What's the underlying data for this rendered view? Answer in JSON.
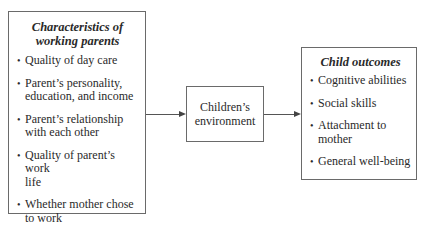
{
  "diagram": {
    "left_box": {
      "title_line1": "Characteristics of",
      "title_line2": "working parents",
      "items": [
        {
          "line1": "Quality of day care",
          "line2": ""
        },
        {
          "line1": "Parent’s personality,",
          "line2": "education, and income"
        },
        {
          "line1": "Parent’s relationship",
          "line2": "with each other"
        },
        {
          "line1": "Quality of parent’s work",
          "line2": "life"
        },
        {
          "line1": "Whether mother chose",
          "line2": "to work"
        }
      ]
    },
    "middle_box": {
      "line1": "Children’s",
      "line2": "environment"
    },
    "right_box": {
      "title": "Child outcomes",
      "items": [
        {
          "line1": "Cognitive abilities",
          "line2": ""
        },
        {
          "line1": "Social skills",
          "line2": ""
        },
        {
          "line1": "Attachment to",
          "line2": "mother"
        },
        {
          "line1": "General well-being",
          "line2": ""
        }
      ]
    },
    "bullet_glyph": "•",
    "edges": [
      {
        "from": "left_box",
        "to": "middle_box"
      },
      {
        "from": "middle_box",
        "to": "right_box"
      }
    ]
  }
}
